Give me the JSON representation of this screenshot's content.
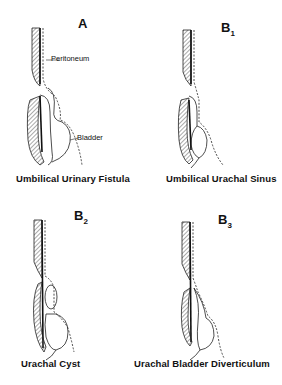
{
  "panels": [
    {
      "id": "A",
      "letter": "A",
      "sub": "",
      "caption": "Umbilical Urinary Fistula",
      "labels": {
        "peritoneum": "Peritoneum",
        "bladder": "Bladder"
      }
    },
    {
      "id": "B1",
      "letter": "B",
      "sub": "1",
      "caption": "Umbilical Urachal Sinus"
    },
    {
      "id": "B2",
      "letter": "B",
      "sub": "2",
      "caption": "Urachal Cyst"
    },
    {
      "id": "B3",
      "letter": "B",
      "sub": "3",
      "caption": "Urachal Bladder Diverticulum"
    }
  ]
}
